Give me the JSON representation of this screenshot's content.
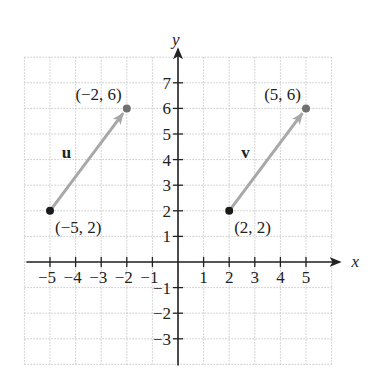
{
  "axes": {
    "x_label": "x",
    "y_label": "y",
    "x_ticks": [
      "−5",
      "−4",
      "−3",
      "−2",
      "−1",
      "1",
      "2",
      "3",
      "4",
      "5"
    ],
    "x_tick_values": [
      -5,
      -4,
      -3,
      -2,
      -1,
      1,
      2,
      3,
      4,
      5
    ],
    "y_ticks": [
      "−3",
      "−2",
      "−1",
      "1",
      "2",
      "3",
      "4",
      "5",
      "6",
      "7"
    ],
    "y_tick_values": [
      -3,
      -2,
      -1,
      1,
      2,
      3,
      4,
      5,
      6,
      7
    ],
    "xlim": [
      -6,
      6
    ],
    "ylim": [
      -4,
      8
    ]
  },
  "vectors": [
    {
      "name": "u",
      "start": {
        "x": -5,
        "y": 2,
        "label": "(−5, 2)"
      },
      "end": {
        "x": -2,
        "y": 6,
        "label": "(−2, 6)"
      }
    },
    {
      "name": "v",
      "start": {
        "x": 2,
        "y": 2,
        "label": "(2, 2)"
      },
      "end": {
        "x": 5,
        "y": 6,
        "label": "(5, 6)"
      }
    }
  ],
  "colors": {
    "axis": "#222222",
    "grid": "#c8c8c8",
    "vector": "#a8a8a8",
    "start_point": "#1a1a1a",
    "end_point": "#707070"
  }
}
